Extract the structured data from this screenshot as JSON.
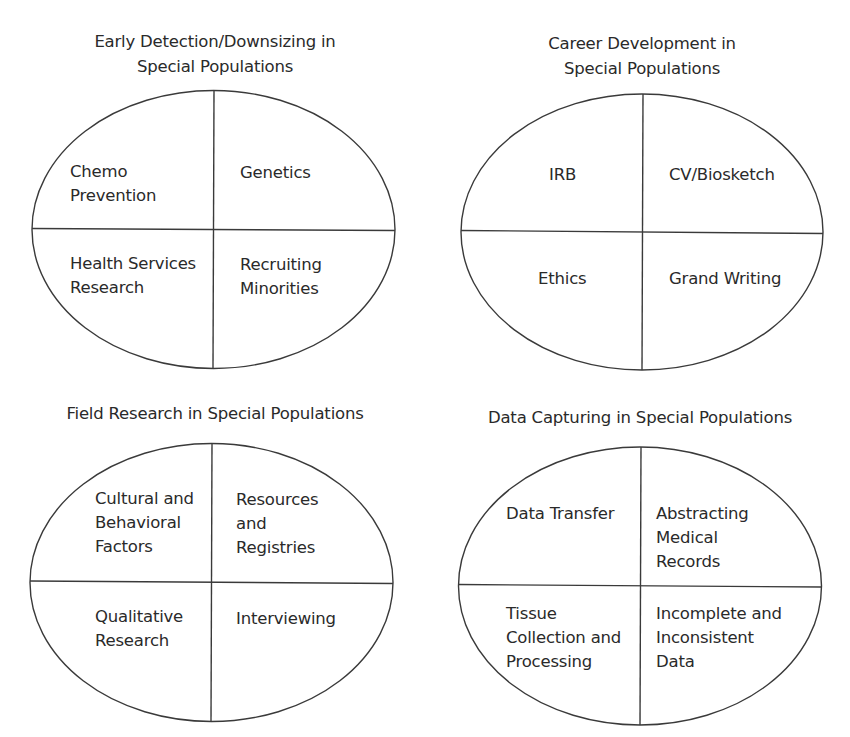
{
  "diagram": {
    "type": "four-quadrant-ellipses",
    "stroke_color": "#3a3a3a",
    "text_color": "#2a2a2a",
    "background": "#ffffff",
    "panels": [
      {
        "id": "early-detection",
        "title": "Early Detection/Downsizing in\nSpecial Populations",
        "quadrants": {
          "top_left": "Chemo\nPrevention",
          "top_right": "Genetics",
          "bottom_left": "Health Services\nResearch",
          "bottom_right": "Recruiting\nMinorities"
        }
      },
      {
        "id": "career-development",
        "title": "Career Development in\nSpecial Populations",
        "quadrants": {
          "top_left": "IRB",
          "top_right": "CV/Biosketch",
          "bottom_left": "Ethics",
          "bottom_right": "Grand Writing"
        }
      },
      {
        "id": "field-research",
        "title": "Field Research in Special Populations",
        "quadrants": {
          "top_left": "Cultural and\nBehavioral\nFactors",
          "top_right": "Resources\nand\nRegistries",
          "bottom_left": "Qualitative\nResearch",
          "bottom_right": "Interviewing"
        }
      },
      {
        "id": "data-capturing",
        "title": "Data Capturing in Special Populations",
        "quadrants": {
          "top_left": "Data Transfer",
          "top_right": "Abstracting\nMedical\nRecords",
          "bottom_left": "Tissue\nCollection and\nProcessing",
          "bottom_right": "Incomplete and\nInconsistent\nData"
        }
      }
    ]
  }
}
